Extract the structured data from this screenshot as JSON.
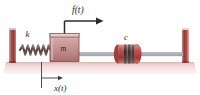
{
  "figure": {
    "background_color": "#ffffff"
  },
  "labels": {
    "spring_stiffness": "k",
    "mass": "m",
    "damping": "c",
    "applied_force": "f(t)",
    "displacement": "x(t)"
  },
  "colors": {
    "wall": "#b05a56",
    "wall_dark": "#8e3a38",
    "floor": "#f2d9d8",
    "mass_fill": "#c89a99",
    "mass_edge": "#7d4746",
    "damper_body": "#c0504d",
    "damper_band": "#3b3b3b",
    "rod": "#8a8a8a",
    "spring": "#5a4240",
    "arrow": "#2b2b2b",
    "text": "#2b2b2b"
  },
  "components": [
    {
      "name": "left-wall",
      "label": ""
    },
    {
      "name": "right-wall",
      "label": ""
    },
    {
      "name": "floor",
      "label": ""
    },
    {
      "name": "spring",
      "label": "k"
    },
    {
      "name": "mass-block",
      "label": "m"
    },
    {
      "name": "damper",
      "label": "c"
    },
    {
      "name": "connecting-rod",
      "label": ""
    },
    {
      "name": "force-arrow",
      "label": "f(t)"
    },
    {
      "name": "displacement-arrow",
      "label": "x(t)"
    }
  ]
}
